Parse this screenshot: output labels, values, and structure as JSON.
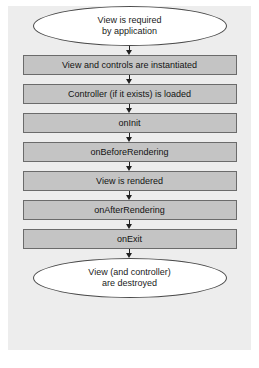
{
  "diagram": {
    "type": "flowchart",
    "orientation": "vertical",
    "canvas_color": "#ededed",
    "process_fill": "#c4c4c4",
    "process_border": "#6b6b6b",
    "terminator_fill": "#ffffff",
    "terminator_border": "#4a4a4a",
    "arrow_color": "#202020",
    "start": {
      "shape": "ellipse",
      "line1": "View is required",
      "line2": "by application"
    },
    "steps": [
      {
        "label": "View and controls are instantiated"
      },
      {
        "label": "Controller (if it exists) is loaded"
      },
      {
        "label": "onInit"
      },
      {
        "label": "onBeforeRendering"
      },
      {
        "label": "View is rendered"
      },
      {
        "label": "onAfterRendering"
      },
      {
        "label": "onExit"
      }
    ],
    "end": {
      "shape": "ellipse",
      "line1": "View (and controller)",
      "line2": "are destroyed"
    }
  }
}
